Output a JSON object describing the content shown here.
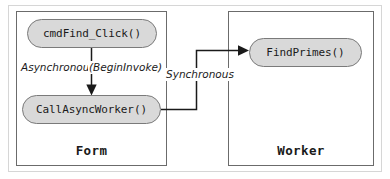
{
  "diagram": {
    "type": "flow-diagram",
    "colors": {
      "pill_fill": "#d9d9d9",
      "pill_stroke": "#7a7a7a",
      "box_stroke": "#6b6b6b",
      "outer_frame": "#d6d6d6",
      "wire": "#1a1a1a",
      "text": "#1a1a1a",
      "background": "#ffffff"
    },
    "containers": [
      {
        "id": "form",
        "label": "Form"
      },
      {
        "id": "worker",
        "label": "Worker"
      }
    ],
    "nodes": [
      {
        "id": "cmdfind",
        "label": "cmdFind_Click()",
        "container": "form"
      },
      {
        "id": "callasync",
        "label": "CallAsyncWorker()",
        "container": "form"
      },
      {
        "id": "findprimes",
        "label": "FindPrimes()",
        "container": "worker"
      }
    ],
    "edges": [
      {
        "id": "edge-async",
        "from": "cmdfind",
        "to": "callasync",
        "label": "Asynchronous",
        "label_secondary": "(BeginInvoke)",
        "direction": "down",
        "arrowhead": true
      },
      {
        "id": "edge-sync",
        "from": "callasync",
        "to": "findprimes",
        "label": "Synchronous",
        "direction": "right-elbow-up",
        "arrowhead": true
      }
    ]
  }
}
